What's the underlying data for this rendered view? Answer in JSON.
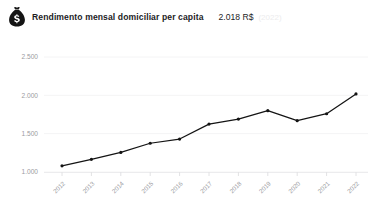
{
  "header": {
    "icon": "money-bag-icon",
    "title": "Rendimento mensal domiciliar per capita",
    "value": "2.018 R$",
    "period": "(2022)"
  },
  "chart_data": {
    "type": "line",
    "title": "Rendimento mensal domiciliar per capita",
    "xlabel": "",
    "ylabel": "",
    "categories": [
      "2012",
      "2013",
      "2014",
      "2015",
      "2016",
      "2017",
      "2018",
      "2019",
      "2020",
      "2021",
      "2022"
    ],
    "values": [
      1080,
      1165,
      1255,
      1375,
      1430,
      1625,
      1690,
      1800,
      1670,
      1760,
      2018
    ],
    "ylim": [
      1000,
      2500
    ],
    "yticks": [
      1000,
      1500,
      2000,
      2500
    ],
    "ytick_labels": [
      "1.000",
      "1.500",
      "2.000",
      "2.500"
    ],
    "grid": true,
    "legend": false,
    "series": [
      {
        "name": "Rendimento mensal domiciliar per capita",
        "color": "#141414",
        "values": [
          1080,
          1165,
          1255,
          1375,
          1430,
          1625,
          1690,
          1800,
          1670,
          1760,
          2018
        ]
      }
    ]
  }
}
